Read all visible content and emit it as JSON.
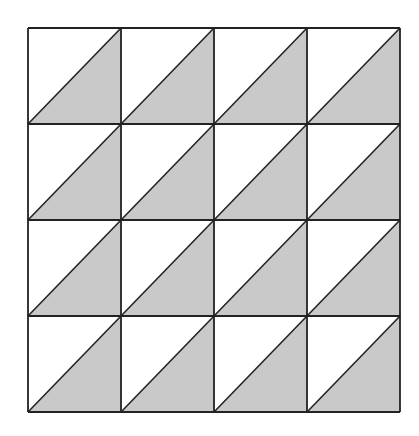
{
  "diagram": {
    "title": "",
    "rows": 4,
    "cols": 4,
    "origin": [
      28,
      28
    ],
    "col_edges": [
      28,
      121,
      214,
      307,
      400
    ],
    "row_edges": [
      28,
      124,
      220,
      316,
      412
    ],
    "cell_pattern": "diagonal from bottom-left to top-right; lower-right triangle shaded",
    "colors": {
      "shade": "#c9c9c9",
      "line": "#222222",
      "background": "#ffffff"
    }
  }
}
